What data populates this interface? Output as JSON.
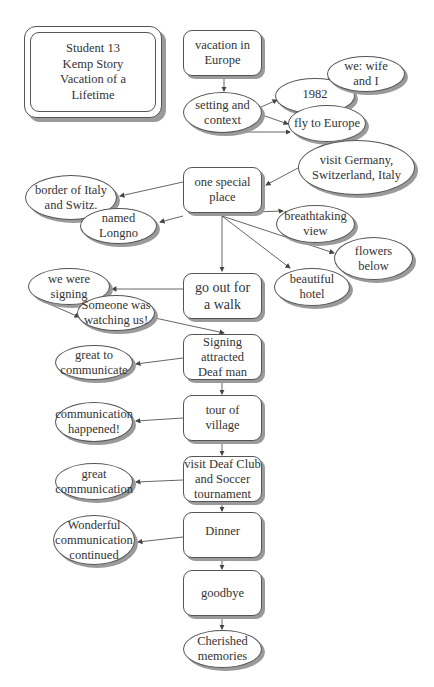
{
  "title": {
    "text": "Student 13\nKemp Story\nVacation of a\nLifetime"
  },
  "nodes": {
    "vacation": {
      "label": "vacation in\nEurope",
      "shape": "box"
    },
    "setting": {
      "label": "setting and\ncontext",
      "shape": "ellipse"
    },
    "year": {
      "label": "1982",
      "shape": "ellipse"
    },
    "we": {
      "label": "we: wife\nand I",
      "shape": "ellipse"
    },
    "fly": {
      "label": "fly to Europe",
      "shape": "ellipse"
    },
    "visit_countries": {
      "label": "visit Germany,\nSwitzerland, Italy",
      "shape": "ellipse"
    },
    "special_place": {
      "label": "one special\nplace",
      "shape": "box"
    },
    "border": {
      "label": "border of Italy\nand Switz.",
      "shape": "ellipse"
    },
    "longno": {
      "label": "named\nLongno",
      "shape": "ellipse"
    },
    "breathtaking": {
      "label": "breathtaking\nview",
      "shape": "ellipse"
    },
    "flowers": {
      "label": "flowers\nbelow",
      "shape": "ellipse"
    },
    "hotel": {
      "label": "beautiful\nhotel",
      "shape": "ellipse"
    },
    "walk": {
      "label": "go out for\na walk",
      "shape": "box"
    },
    "signing": {
      "label": "we were\nsigning",
      "shape": "ellipse"
    },
    "watching": {
      "label": "Someone was\nwatching us!",
      "shape": "ellipse"
    },
    "attracted": {
      "label": "Signing\nattracted\nDeaf man",
      "shape": "box"
    },
    "great_to": {
      "label": "great to\ncommunicate",
      "shape": "ellipse"
    },
    "tour": {
      "label": "tour of\nvillage",
      "shape": "box"
    },
    "comm_happened": {
      "label": "communication\nhappened!",
      "shape": "ellipse"
    },
    "deaf_club": {
      "label": "visit Deaf Club\nand Soccer\ntournament",
      "shape": "box"
    },
    "great_comm": {
      "label": "great\ncommunication",
      "shape": "ellipse"
    },
    "dinner": {
      "label": "Dinner",
      "shape": "box"
    },
    "wonderful": {
      "label": "Wonderful\ncommunication\ncontinued",
      "shape": "ellipse"
    },
    "goodbye": {
      "label": "goodbye",
      "shape": "box"
    },
    "cherished": {
      "label": "Cherished\nmemories",
      "shape": "ellipse"
    }
  },
  "edges": [
    [
      "vacation",
      "setting"
    ],
    [
      "setting",
      "year"
    ],
    [
      "setting",
      "fly"
    ],
    [
      "setting",
      "fly"
    ],
    [
      "visit_countries",
      "special_place"
    ],
    [
      "special_place",
      "border"
    ],
    [
      "special_place",
      "longno"
    ],
    [
      "special_place",
      "breathtaking"
    ],
    [
      "special_place",
      "flowers"
    ],
    [
      "special_place",
      "hotel"
    ],
    [
      "special_place",
      "walk"
    ],
    [
      "walk",
      "signing"
    ],
    [
      "signing",
      "watching"
    ],
    [
      "watching",
      "attracted"
    ],
    [
      "attracted",
      "great_to"
    ],
    [
      "attracted",
      "tour"
    ],
    [
      "tour",
      "comm_happened"
    ],
    [
      "tour",
      "deaf_club"
    ],
    [
      "deaf_club",
      "great_comm"
    ],
    [
      "deaf_club",
      "dinner"
    ],
    [
      "dinner",
      "wonderful"
    ],
    [
      "dinner",
      "goodbye"
    ],
    [
      "goodbye",
      "cherished"
    ]
  ],
  "colors": {
    "stroke": "#555555",
    "shadow": "#9a9a9a",
    "text": "#333333",
    "background": "#ffffff"
  }
}
